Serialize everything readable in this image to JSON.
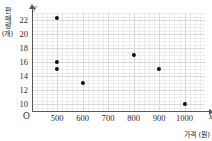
{
  "chart_data": {
    "type": "scatter",
    "title": "",
    "xlabel": "가격 (원)",
    "ylabel": "판매량 (개)",
    "ylabel_chars": [
      "판",
      "매",
      "량",
      "(개)"
    ],
    "x_axis_letter": "x",
    "y_axis_letter": "y",
    "origin_label": "O",
    "xticks": [
      500,
      600,
      700,
      800,
      900,
      1000
    ],
    "yticks": [
      10,
      12,
      14,
      16,
      18,
      20,
      22
    ],
    "xlim": [
      400,
      1080
    ],
    "ylim": [
      9,
      23
    ],
    "grid": true,
    "legend": "none",
    "points": [
      {
        "x": 500,
        "y": 22.3
      },
      {
        "x": 500,
        "y": 16
      },
      {
        "x": 500,
        "y": 15
      },
      {
        "x": 600,
        "y": 13
      },
      {
        "x": 800,
        "y": 17
      },
      {
        "x": 900,
        "y": 15
      },
      {
        "x": 1000,
        "y": 10
      }
    ],
    "colors": {
      "point": "#111111",
      "axis": "#58585a",
      "grid_major": "#d9d9d9",
      "grid_minor": "#ececec",
      "background": "#ffffff"
    }
  }
}
